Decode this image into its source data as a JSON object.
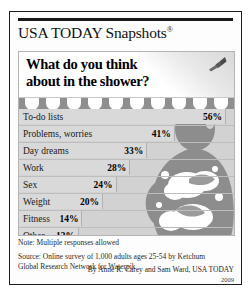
{
  "masthead": {
    "brand": "USA TODAY Snapshots",
    "registered_mark": "®"
  },
  "chart_data": {
    "type": "bar",
    "title": "What do you think about in the shower?",
    "title_line1": "What do you think",
    "title_line2": "about in the shower?",
    "xlabel": "",
    "ylabel": "",
    "xlim": [
      0,
      56
    ],
    "grid": false,
    "legend": false,
    "unit": "%",
    "categories": [
      "To-do lists",
      "Problems, worries",
      "Day dreams",
      "Work",
      "Sex",
      "Weight",
      "Fitness",
      "Other"
    ],
    "values": [
      56,
      41,
      33,
      28,
      24,
      20,
      14,
      13
    ],
    "value_labels": [
      "56%",
      "41%",
      "33%",
      "28%",
      "24%",
      "20%",
      "14%",
      "13%"
    ]
  },
  "notes": {
    "note": "Note: Multiple responses allowed",
    "source_line1": "Source: Online survey of 1,000 adults ages 25-54 by Ketchum",
    "source_line2": "Global Research Network for Waterpik"
  },
  "byline": {
    "credit": "By Anne R. Carey and Sam Ward, USA TODAY",
    "year": "2009"
  },
  "icons": {
    "showerhead": "showerhead-icon",
    "bather": "bathing-figure-silhouette"
  },
  "colors": {
    "frame": "#1d1d1d",
    "panel_bg": "#d2d2d2",
    "bar_fill": "#d9d9d9",
    "droplet_band": "#8f8f8f",
    "figure": "#8d8d8d"
  }
}
